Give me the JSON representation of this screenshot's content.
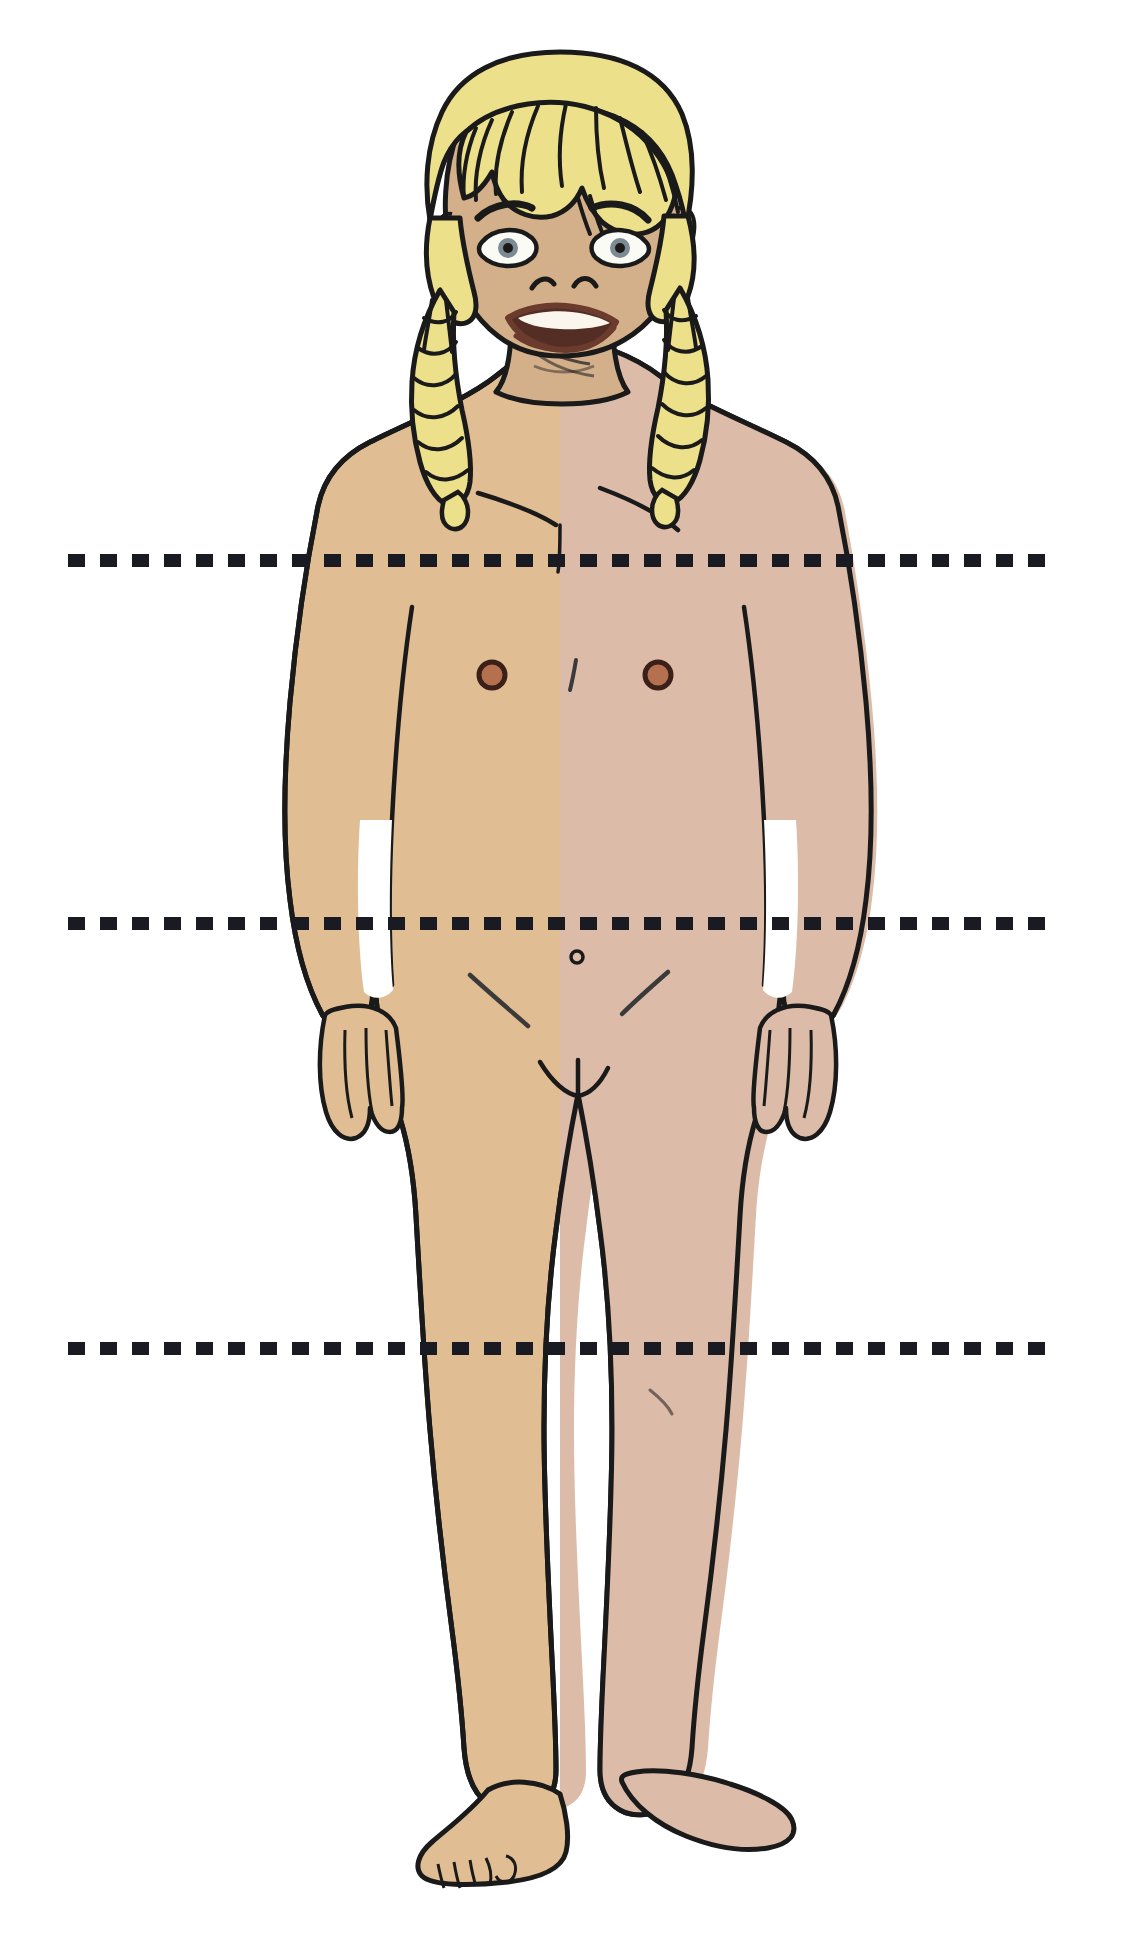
{
  "document": {
    "title": "Child body — anterior view with three horizontal reference lines",
    "background_color": "#ffffff",
    "width": 1121,
    "height": 1951
  },
  "figure": {
    "name": "standing child, front view, unclothed",
    "pose": "standing, arms at sides, facing viewer",
    "expression": "surprised, mouth open, eyes wide",
    "hair": {
      "style": "blonde with fringe and two braided pigtails",
      "color": "#EDE08A",
      "shadow_color": "#DCCE6E",
      "outline_color": "#1a1a1a"
    },
    "skin": {
      "left_half_color": "#E0BD92",
      "right_half_color": "#DCBCA8",
      "face_color": "#D4B08A",
      "shadow_color": "#C9A074",
      "outline_color": "#1a1a1a"
    },
    "features": {
      "nipple_color": "#B5714F",
      "nipple_outline": "#3A2018",
      "lip_color": "#6B3B2E",
      "mouth_inner": "#542E24",
      "teeth_color": "#FAF6EE",
      "eye_white": "#FBFBF6",
      "iris_color": "#7C8A91",
      "pupil_color": "#1a1a1a"
    }
  },
  "reference_lines": {
    "style": "dashed",
    "color": "#1a1a22",
    "thickness_px": 13,
    "dash_length_px": 17,
    "gap_length_px": 15,
    "items": [
      {
        "id": "line-1",
        "label": "shoulder line",
        "y": 560,
        "x_start": 68,
        "x_end": 1056
      },
      {
        "id": "line-2",
        "label": "hip line",
        "y": 923,
        "x_start": 68,
        "x_end": 1056
      },
      {
        "id": "line-3",
        "label": "knee line",
        "y": 1348,
        "x_start": 68,
        "x_end": 1056
      }
    ]
  }
}
